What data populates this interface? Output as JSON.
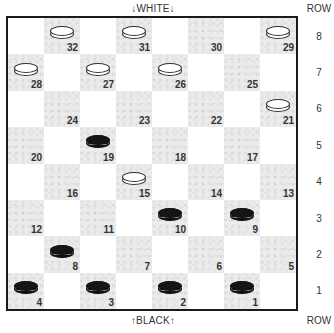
{
  "labels": {
    "top_side": "↓WHITE↓",
    "bottom_side": "↑BLACK↑",
    "row_header_top": "ROW",
    "row_header_bottom": "ROW"
  },
  "row_numbers": [
    "8",
    "7",
    "6",
    "5",
    "4",
    "3",
    "2",
    "1"
  ],
  "colors": {
    "dark_square": "#ebebeb",
    "light_square": "#ffffff",
    "border": "#1a1a1a",
    "black_piece": "#151515",
    "white_piece": "#ffffff"
  },
  "board": {
    "rows": [
      {
        "row": 8,
        "cells": [
          {
            "dark": false
          },
          {
            "dark": true,
            "num": "32",
            "piece": "white"
          },
          {
            "dark": false
          },
          {
            "dark": true,
            "num": "31",
            "piece": "white"
          },
          {
            "dark": false
          },
          {
            "dark": true,
            "num": "30",
            "piece": null
          },
          {
            "dark": false
          },
          {
            "dark": true,
            "num": "29",
            "piece": "white"
          }
        ]
      },
      {
        "row": 7,
        "cells": [
          {
            "dark": true,
            "num": "28",
            "piece": "white"
          },
          {
            "dark": false
          },
          {
            "dark": true,
            "num": "27",
            "piece": "white"
          },
          {
            "dark": false
          },
          {
            "dark": true,
            "num": "26",
            "piece": "white"
          },
          {
            "dark": false
          },
          {
            "dark": true,
            "num": "25",
            "piece": null
          },
          {
            "dark": false
          }
        ]
      },
      {
        "row": 6,
        "cells": [
          {
            "dark": false
          },
          {
            "dark": true,
            "num": "24",
            "piece": null
          },
          {
            "dark": false
          },
          {
            "dark": true,
            "num": "23",
            "piece": null
          },
          {
            "dark": false
          },
          {
            "dark": true,
            "num": "22",
            "piece": null
          },
          {
            "dark": false
          },
          {
            "dark": true,
            "num": "21",
            "piece": "white"
          }
        ]
      },
      {
        "row": 5,
        "cells": [
          {
            "dark": true,
            "num": "20",
            "piece": null
          },
          {
            "dark": false
          },
          {
            "dark": true,
            "num": "19",
            "piece": "black"
          },
          {
            "dark": false
          },
          {
            "dark": true,
            "num": "18",
            "piece": null
          },
          {
            "dark": false
          },
          {
            "dark": true,
            "num": "17",
            "piece": null
          },
          {
            "dark": false
          }
        ]
      },
      {
        "row": 4,
        "cells": [
          {
            "dark": false
          },
          {
            "dark": true,
            "num": "16",
            "piece": null
          },
          {
            "dark": false
          },
          {
            "dark": true,
            "num": "15",
            "piece": "white"
          },
          {
            "dark": false
          },
          {
            "dark": true,
            "num": "14",
            "piece": null
          },
          {
            "dark": false
          },
          {
            "dark": true,
            "num": "13",
            "piece": null
          }
        ]
      },
      {
        "row": 3,
        "cells": [
          {
            "dark": true,
            "num": "12",
            "piece": null
          },
          {
            "dark": false
          },
          {
            "dark": true,
            "num": "11",
            "piece": null
          },
          {
            "dark": false
          },
          {
            "dark": true,
            "num": "10",
            "piece": "black"
          },
          {
            "dark": false
          },
          {
            "dark": true,
            "num": "9",
            "piece": "black"
          },
          {
            "dark": false
          }
        ]
      },
      {
        "row": 2,
        "cells": [
          {
            "dark": false
          },
          {
            "dark": true,
            "num": "8",
            "piece": "black"
          },
          {
            "dark": false
          },
          {
            "dark": true,
            "num": "7",
            "piece": null
          },
          {
            "dark": false
          },
          {
            "dark": true,
            "num": "6",
            "piece": null
          },
          {
            "dark": false
          },
          {
            "dark": true,
            "num": "5",
            "piece": null
          }
        ]
      },
      {
        "row": 1,
        "cells": [
          {
            "dark": true,
            "num": "4",
            "piece": "black"
          },
          {
            "dark": false
          },
          {
            "dark": true,
            "num": "3",
            "piece": "black"
          },
          {
            "dark": false
          },
          {
            "dark": true,
            "num": "2",
            "piece": "black"
          },
          {
            "dark": false
          },
          {
            "dark": true,
            "num": "1",
            "piece": "black"
          },
          {
            "dark": false
          }
        ]
      }
    ]
  },
  "pieces": {
    "white": [
      "32",
      "31",
      "29",
      "28",
      "27",
      "26",
      "21",
      "15"
    ],
    "black": [
      "19",
      "10",
      "9",
      "8",
      "4",
      "3",
      "2",
      "1"
    ]
  }
}
